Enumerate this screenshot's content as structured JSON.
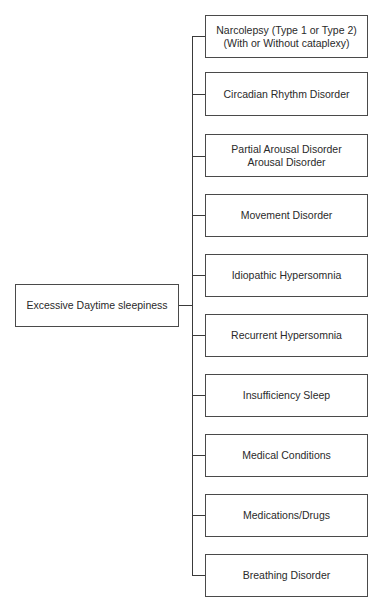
{
  "diagram": {
    "root": {
      "label": "Excessive Daytime sleepiness"
    },
    "children": [
      {
        "label": "Narcolepsy (Type 1 or Type 2)\n(With or Without cataplexy)"
      },
      {
        "label": "Circadian Rhythm Disorder"
      },
      {
        "label": "Partial Arousal Disorder\nArousal Disorder"
      },
      {
        "label": "Movement Disorder"
      },
      {
        "label": "Idiopathic Hypersomnia"
      },
      {
        "label": "Recurrent Hypersomnia"
      },
      {
        "label": "Insufficiency Sleep"
      },
      {
        "label": "Medical Conditions"
      },
      {
        "label": "Medications/Drugs"
      },
      {
        "label": "Breathing Disorder"
      }
    ]
  }
}
